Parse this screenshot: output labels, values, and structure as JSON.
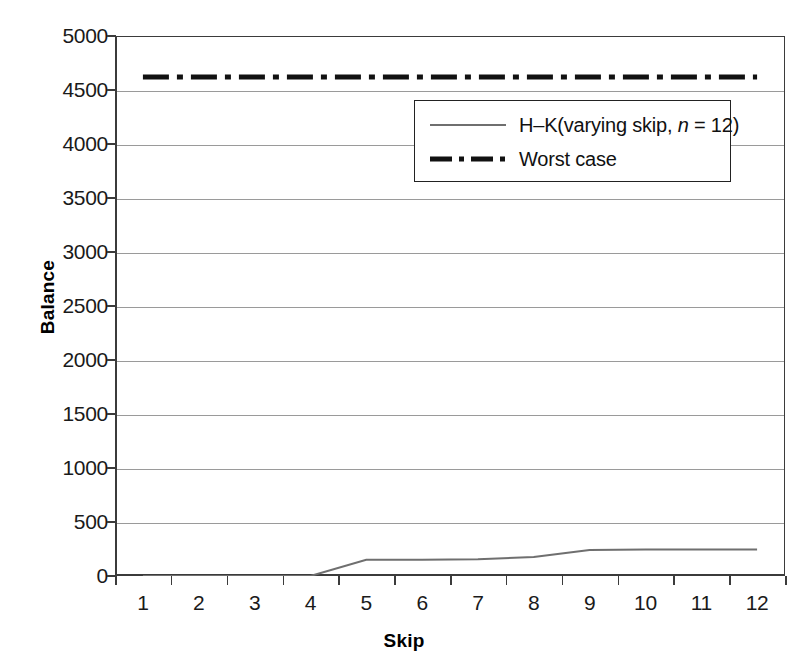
{
  "chart_data": {
    "type": "line",
    "title": "",
    "xlabel": "Skip",
    "ylabel": "Balance",
    "x": [
      1,
      2,
      3,
      4,
      5,
      6,
      7,
      8,
      9,
      10,
      11,
      12
    ],
    "xtick_labels": [
      "1",
      "2",
      "3",
      "4",
      "5",
      "6",
      "7",
      "8",
      "9",
      "10",
      "11",
      "12"
    ],
    "ytick_labels": [
      "0",
      "500",
      "1000",
      "1500",
      "2000",
      "2500",
      "3000",
      "3500",
      "4000",
      "4500",
      "5000"
    ],
    "ytick_values": [
      0,
      500,
      1000,
      1500,
      2000,
      2500,
      3000,
      3500,
      4000,
      4500,
      5000
    ],
    "ylim": [
      0,
      5000
    ],
    "grid": "horizontal",
    "legend_position": "upper-center-right",
    "series": [
      {
        "name": "H–K(varying skip, n = 12)",
        "name_prefix": "H–K(varying skip, ",
        "name_italic": "n",
        "name_suffix": " = 12)",
        "style": "solid",
        "color": "#6f6f6f",
        "width": 2,
        "values": [
          0,
          0,
          0,
          0,
          150,
          150,
          155,
          175,
          240,
          245,
          245,
          245
        ]
      },
      {
        "name": "Worst case",
        "style": "dash-dot",
        "color": "#111111",
        "width": 5,
        "values": [
          4620,
          4620,
          4620,
          4620,
          4620,
          4620,
          4620,
          4620,
          4620,
          4620,
          4620,
          4620
        ]
      }
    ]
  },
  "axes": {
    "y_title": "Balance",
    "x_title": "Skip"
  }
}
